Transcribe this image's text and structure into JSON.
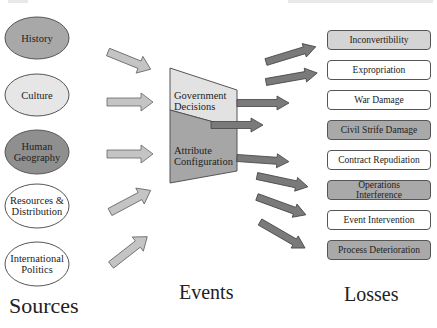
{
  "sources": {
    "title": "Sources",
    "items": [
      {
        "label": "History",
        "fill": "#a8a8a8"
      },
      {
        "label": "Culture",
        "fill": "#e6e6e6"
      },
      {
        "label": "Human Geography",
        "line1": "Human",
        "line2": "Geography",
        "fill": "#8f8f8f"
      },
      {
        "label": "Resources & Distribution",
        "line1": "Resources &",
        "line2": "Distribution",
        "fill": "#ffffff"
      },
      {
        "label": "International Politics",
        "line1": "International",
        "line2": "Politics",
        "fill": "#ffffff"
      }
    ]
  },
  "events": {
    "title": "Events",
    "top_section": {
      "line1": "Government",
      "line2": "Decisions",
      "fill": "#e2e2e2"
    },
    "bottom_section": {
      "line1": "Attribute",
      "line2": "Configuration",
      "fill": "#a6a6a6"
    }
  },
  "losses": {
    "title": "Losses",
    "items": [
      {
        "label": "Inconvertibility",
        "style": "light"
      },
      {
        "label": "Expropriation",
        "style": "white"
      },
      {
        "label": "War Damage",
        "style": "white"
      },
      {
        "label": "Civil Strife Damage",
        "style": "shaded"
      },
      {
        "label": "Contract Repudiation",
        "style": "white"
      },
      {
        "label": "Operations Interference",
        "line1": "Operations",
        "line2": "Interference",
        "style": "shaded"
      },
      {
        "label": "Event Intervention",
        "style": "white"
      },
      {
        "label": "Process Deterioration",
        "style": "shaded"
      }
    ]
  },
  "colors": {
    "source_arrow": "#c4c4c4",
    "loss_arrow": "#7a7a7a",
    "outline": "#555555"
  }
}
